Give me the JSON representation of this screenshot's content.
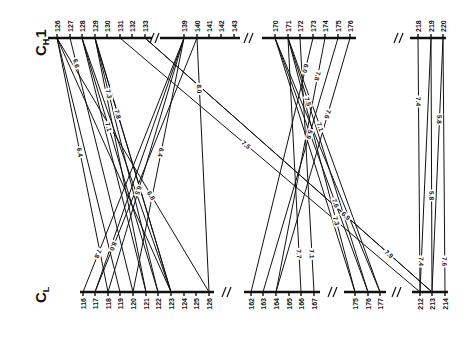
{
  "chains": {
    "top": {
      "label": "C",
      "subscript": "H",
      "suffix": "1"
    },
    "bottom": {
      "label": "C",
      "subscript": "L",
      "suffix": ""
    }
  },
  "top_axis": {
    "y": 38,
    "segments": [
      [
        48,
        152
      ],
      [
        160,
        240
      ],
      [
        262,
        356
      ],
      [
        410,
        446
      ]
    ],
    "breaks": [
      156,
      250,
      400
    ],
    "ticks": [
      {
        "residue": "126",
        "x": 57
      },
      {
        "residue": "127",
        "x": 70
      },
      {
        "residue": "128",
        "x": 82
      },
      {
        "residue": "129",
        "x": 95
      },
      {
        "residue": "130",
        "x": 107
      },
      {
        "residue": "131",
        "x": 120
      },
      {
        "residue": "132",
        "x": 132
      },
      {
        "residue": "133",
        "x": 145
      },
      {
        "residue": "139",
        "x": 184
      },
      {
        "residue": "140",
        "x": 197
      },
      {
        "residue": "141",
        "x": 209
      },
      {
        "residue": "142",
        "x": 221
      },
      {
        "residue": "143",
        "x": 234
      },
      {
        "residue": "170",
        "x": 275
      },
      {
        "residue": "171",
        "x": 288
      },
      {
        "residue": "172",
        "x": 300
      },
      {
        "residue": "173",
        "x": 313
      },
      {
        "residue": "174",
        "x": 325
      },
      {
        "residue": "175",
        "x": 338
      },
      {
        "residue": "176",
        "x": 350
      },
      {
        "residue": "218",
        "x": 418
      },
      {
        "residue": "219",
        "x": 431
      },
      {
        "residue": "220",
        "x": 443
      }
    ]
  },
  "bottom_axis": {
    "y": 292,
    "segments": [
      [
        80,
        214
      ],
      [
        244,
        320
      ],
      [
        344,
        386
      ],
      [
        412,
        448
      ]
    ],
    "breaks": [
      228,
      334,
      398
    ],
    "ticks": [
      {
        "residue": "116",
        "x": 83
      },
      {
        "residue": "117",
        "x": 95
      },
      {
        "residue": "118",
        "x": 108
      },
      {
        "residue": "119",
        "x": 120
      },
      {
        "residue": "120",
        "x": 133
      },
      {
        "residue": "121",
        "x": 146
      },
      {
        "residue": "122",
        "x": 158
      },
      {
        "residue": "123",
        "x": 171
      },
      {
        "residue": "124",
        "x": 184
      },
      {
        "residue": "125",
        "x": 196
      },
      {
        "residue": "126",
        "x": 209
      },
      {
        "residue": "162",
        "x": 251
      },
      {
        "residue": "163",
        "x": 263
      },
      {
        "residue": "164",
        "x": 276
      },
      {
        "residue": "165",
        "x": 289
      },
      {
        "residue": "166",
        "x": 301
      },
      {
        "residue": "167",
        "x": 314
      },
      {
        "residue": "175",
        "x": 355
      },
      {
        "residue": "176",
        "x": 368
      },
      {
        "residue": "177",
        "x": 380
      },
      {
        "residue": "212",
        "x": 420
      },
      {
        "residue": "213",
        "x": 432
      },
      {
        "residue": "214",
        "x": 445
      }
    ]
  },
  "contacts": [
    {
      "from": "126",
      "to": "118",
      "x1": 57,
      "x2": 108,
      "dist": "6.4",
      "t": 0.45
    },
    {
      "from": "126",
      "to": "119",
      "x1": 57,
      "x2": 120
    },
    {
      "from": "126",
      "to": "171",
      "x1": 57,
      "x2": 171
    },
    {
      "from": "127",
      "to": "120",
      "x1": 70,
      "x2": 133,
      "dist": "6.6",
      "t": 0.1
    },
    {
      "from": "128",
      "to": "121",
      "x1": 82,
      "x2": 146
    },
    {
      "from": "128",
      "to": "122",
      "x1": 82,
      "x2": 158,
      "dist": "7.1",
      "t": 0.35
    },
    {
      "from": "128",
      "to": "123",
      "x1": 82,
      "x2": 171
    },
    {
      "from": "129",
      "to": "121",
      "x1": 95,
      "x2": 146
    },
    {
      "from": "129",
      "to": "122",
      "x1": 95,
      "x2": 158,
      "dist": "7.3",
      "t": 0.22
    },
    {
      "from": "129",
      "to": "123",
      "x1": 95,
      "x2": 171,
      "dist": "7.8",
      "t": 0.3
    },
    {
      "from": "129",
      "to": "123b",
      "x1": 95,
      "x2": 171
    },
    {
      "from": "131",
      "to": "212",
      "x1": 120,
      "x2": 420,
      "dist": "7.5",
      "t": 0.42
    },
    {
      "from": "133",
      "to": "213",
      "x1": 145,
      "x2": 432,
      "dist": "6.9",
      "t": 0.7
    },
    {
      "from": "133",
      "to": "213b",
      "x1": 145,
      "x2": 432,
      "dist": "7.9",
      "t": 0.85
    },
    {
      "from": "139",
      "to": "116",
      "x1": 184,
      "x2": 83,
      "dist": "7.8",
      "t": 0.85
    },
    {
      "from": "139",
      "to": "117",
      "x1": 184,
      "x2": 95
    },
    {
      "from": "139",
      "to": "118",
      "x1": 184,
      "x2": 108,
      "dist": "6.5",
      "t": 0.6
    },
    {
      "from": "139",
      "to": "120",
      "x1": 184,
      "x2": 133,
      "dist": "6.4",
      "t": 0.45
    },
    {
      "from": "140",
      "to": "117",
      "x1": 197,
      "x2": 95,
      "dist": "8.0",
      "t": 0.82
    },
    {
      "from": "140",
      "to": "126",
      "x1": 197,
      "x2": 209,
      "dist": "8.0",
      "t": 0.2
    },
    {
      "from": "126",
      "to": "126c",
      "x1": 57,
      "x2": 209,
      "dist": "6.8",
      "t": 0.62
    },
    {
      "from": "170",
      "to": "175",
      "x1": 275,
      "x2": 355
    },
    {
      "from": "170",
      "to": "176",
      "x1": 275,
      "x2": 368,
      "dist": "7.6",
      "t": 0.65
    },
    {
      "from": "170",
      "to": "177",
      "x1": 275,
      "x2": 380
    },
    {
      "from": "171",
      "to": "175",
      "x1": 288,
      "x2": 355,
      "dist": "7.3",
      "t": 0.72
    },
    {
      "from": "171",
      "to": "176",
      "x1": 288,
      "x2": 368,
      "dist": "7.5",
      "t": 0.25
    },
    {
      "from": "171",
      "to": "177",
      "x1": 288,
      "x2": 380,
      "dist": "7.1",
      "t": 0.35
    },
    {
      "from": "171",
      "to": "166",
      "x1": 288,
      "x2": 301,
      "dist": "7.7",
      "t": 0.85
    },
    {
      "from": "172",
      "to": "167",
      "x1": 300,
      "x2": 314,
      "dist": "7.1",
      "t": 0.85
    },
    {
      "from": "173",
      "to": "162",
      "x1": 313,
      "x2": 251,
      "dist": "6.0",
      "t": 0.12
    },
    {
      "from": "174",
      "to": "164",
      "x1": 325,
      "x2": 276,
      "dist": "7.8",
      "t": 0.15
    },
    {
      "from": "175",
      "to": "163",
      "x1": 338,
      "x2": 263,
      "dist": "5.9",
      "t": 0.38
    },
    {
      "from": "176",
      "to": "164",
      "x1": 350,
      "x2": 276,
      "dist": "7.6",
      "t": 0.3
    },
    {
      "from": "218",
      "to": "212",
      "x1": 418,
      "x2": 420,
      "dist": "7.4",
      "t": 0.25
    },
    {
      "from": "219",
      "to": "213",
      "x1": 431,
      "x2": 432,
      "dist": "5.8",
      "t": 0.62
    },
    {
      "from": "220",
      "to": "213",
      "x1": 443,
      "x2": 432,
      "dist": "5.8",
      "t": 0.32
    },
    {
      "from": "219",
      "to": "212",
      "x1": 431,
      "x2": 420,
      "dist": "7.4",
      "t": 0.88
    },
    {
      "from": "220",
      "to": "214",
      "x1": 443,
      "x2": 445,
      "dist": "7.6",
      "t": 0.88
    }
  ]
}
